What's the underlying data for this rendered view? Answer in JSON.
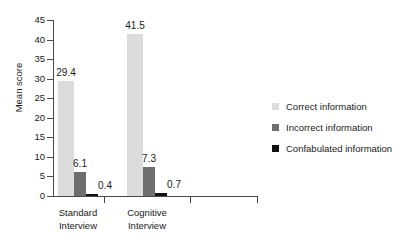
{
  "chart_data": {
    "type": "bar",
    "title": "",
    "xlabel": "",
    "ylabel": "Mean score",
    "ylim": [
      0,
      45
    ],
    "yticks": [
      0,
      5,
      10,
      15,
      20,
      25,
      30,
      35,
      40,
      45
    ],
    "grid": false,
    "legend_position": "right",
    "categories": [
      "Standard Interview",
      "Cognitive Interview"
    ],
    "category_lines": [
      [
        "Standard",
        "Interview"
      ],
      [
        "Cognitive",
        "Interview"
      ]
    ],
    "series": [
      {
        "name": "Correct information",
        "color": "#dcdcdc",
        "values": [
          29.4,
          41.5
        ],
        "labels": [
          "29.4",
          "41.5"
        ]
      },
      {
        "name": "Incorrect information",
        "color": "#6e6e6e",
        "values": [
          6.1,
          7.3
        ],
        "labels": [
          "6.1",
          "7.3"
        ]
      },
      {
        "name": "Confabulated information",
        "color": "#111111",
        "values": [
          0.4,
          0.7
        ],
        "labels": [
          "0.4",
          "0.7"
        ]
      }
    ],
    "axis_color": "#4a4a4a",
    "text_color": "#1a1a1a",
    "background": "#ffffff"
  },
  "legend": {
    "items": [
      {
        "label": "Correct information",
        "color": "#dcdcdc"
      },
      {
        "label": "Incorrect information",
        "color": "#6e6e6e"
      },
      {
        "label": "Confabulated information",
        "color": "#111111"
      }
    ]
  }
}
